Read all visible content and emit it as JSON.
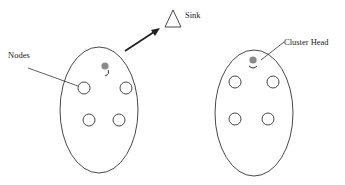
{
  "diagram": {
    "labels": {
      "nodes": "Nodes",
      "sink": "Sink",
      "cluster_head": "Cluster Head"
    },
    "clusters": [
      {
        "id": "left",
        "node_count": 4,
        "has_cluster_head": true
      },
      {
        "id": "right",
        "node_count": 4,
        "has_cluster_head": true
      }
    ],
    "colors": {
      "stroke": "#333333",
      "cluster_head_fill": "#8a8a8a",
      "background": "#ffffff"
    }
  }
}
